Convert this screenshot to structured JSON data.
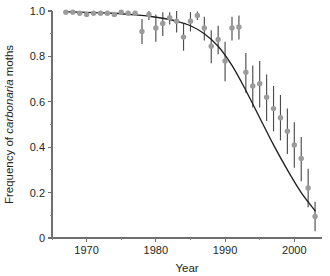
{
  "figure": {
    "title": "",
    "ylabel_prefix": "Frequency of ",
    "ylabel_italic": "carbonaria",
    "ylabel_suffix": " moths",
    "xlabel": "Year",
    "marker_color": "#9b9b9b",
    "errorbar_color": "#4d4d4d",
    "line_color": "#231f20",
    "axis_color": "#6f6f6f",
    "background": "#ffffff"
  },
  "chart_data": {
    "type": "scatter",
    "title": "",
    "xlabel": "Year",
    "ylabel": "Frequency of carbonaria moths",
    "xlim": [
      1965,
      2004
    ],
    "ylim": [
      0,
      1.0
    ],
    "grid": false,
    "legend": null,
    "xticks": [
      1970,
      1980,
      1990,
      2000
    ],
    "xtick_labels": [
      "1970",
      "1980",
      "1990",
      "2000"
    ],
    "xminor_ticks": [
      1965,
      1975,
      1985,
      1995
    ],
    "yticks": [
      0,
      0.2,
      0.4,
      0.6,
      0.8,
      1.0
    ],
    "ytick_labels": [
      "0",
      "0.2",
      "0.4",
      "0.6",
      "0.8",
      "1.0"
    ],
    "yminor_ticks": [
      0.1,
      0.3,
      0.5,
      0.7,
      0.9
    ],
    "series": [
      {
        "name": "carbonaria frequency",
        "marker": "circle",
        "color": "#9b9b9b",
        "x": [
          1967,
          1968,
          1969,
          1970,
          1971,
          1972,
          1973,
          1974,
          1975,
          1976,
          1977,
          1978,
          1979,
          1980,
          1981,
          1982,
          1983,
          1984,
          1985,
          1986,
          1987,
          1988,
          1989,
          1990,
          1991,
          1992,
          1993,
          1994,
          1995,
          1996,
          1997,
          1998,
          1999,
          2000,
          2001,
          2002,
          2003
        ],
        "y": [
          0.995,
          0.995,
          0.99,
          0.985,
          0.99,
          0.99,
          0.99,
          0.985,
          0.995,
          0.99,
          0.99,
          0.91,
          0.985,
          0.925,
          0.945,
          0.97,
          0.955,
          0.885,
          0.955,
          0.98,
          0.925,
          0.845,
          0.875,
          0.78,
          0.925,
          0.93,
          0.73,
          0.67,
          0.68,
          0.62,
          0.57,
          0.53,
          0.47,
          0.41,
          0.35,
          0.22,
          0.095
        ],
        "yerr_low": [
          0.0,
          0.0,
          0.0,
          0.0,
          0.0,
          0.0,
          0.0,
          0.0,
          0.0,
          0.0,
          0.0,
          0.055,
          0.025,
          0.06,
          0.055,
          0.03,
          0.05,
          0.06,
          0.045,
          0.02,
          0.055,
          0.075,
          0.065,
          0.09,
          0.055,
          0.055,
          0.09,
          0.095,
          0.105,
          0.105,
          0.1,
          0.1,
          0.1,
          0.1,
          0.1,
          0.085,
          0.065
        ],
        "yerr_high": [
          0.0,
          0.0,
          0.0,
          0.0,
          0.0,
          0.0,
          0.0,
          0.0,
          0.0,
          0.0,
          0.0,
          0.055,
          0.015,
          0.06,
          0.05,
          0.025,
          0.045,
          0.06,
          0.04,
          0.018,
          0.05,
          0.07,
          0.06,
          0.085,
          0.05,
          0.05,
          0.085,
          0.09,
          0.1,
          0.1,
          0.1,
          0.1,
          0.1,
          0.1,
          0.095,
          0.085,
          0.065
        ]
      }
    ],
    "fit_curve": {
      "name": "logistic fit",
      "color": "#231f20",
      "x": [
        1967,
        1969,
        1971,
        1973,
        1975,
        1977,
        1979,
        1981,
        1983,
        1985,
        1987,
        1989,
        1991,
        1993,
        1995,
        1997,
        1999,
        2001,
        2003
      ],
      "y": [
        0.996,
        0.995,
        0.993,
        0.991,
        0.988,
        0.983,
        0.977,
        0.968,
        0.955,
        0.935,
        0.9,
        0.845,
        0.76,
        0.65,
        0.53,
        0.41,
        0.3,
        0.2,
        0.12
      ]
    }
  }
}
